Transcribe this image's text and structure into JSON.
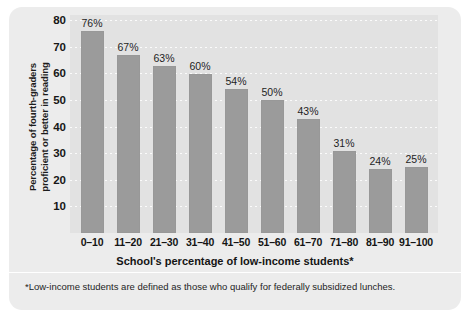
{
  "chart_data": {
    "type": "bar",
    "title": "",
    "subtitle": "",
    "xlabel": "School's percentage of low-income students*",
    "ylabel_line1": "Percentage of fourth-graders",
    "ylabel_line2": "proficient or better in reading",
    "categories": [
      "0–10",
      "11–20",
      "21–30",
      "31–40",
      "41–50",
      "51–60",
      "61–70",
      "71–80",
      "81–90",
      "91–100"
    ],
    "values": [
      76,
      67,
      63,
      60,
      54,
      50,
      43,
      31,
      24,
      25
    ],
    "value_labels": [
      "76%",
      "67%",
      "63%",
      "60%",
      "54%",
      "50%",
      "43%",
      "31%",
      "24%",
      "25%"
    ],
    "ylim": [
      0,
      82
    ],
    "yticks": [
      10,
      20,
      30,
      40,
      50,
      60,
      70,
      80
    ],
    "ytick_labels": [
      "10",
      "20",
      "30",
      "40",
      "50",
      "60",
      "70",
      "80"
    ],
    "grid": true,
    "grid_style": "dotted-white-horizontal",
    "legend": "none",
    "bar_color": "#9b9b9b",
    "plot_background": "#e2e2e2",
    "panel_background": "#ececec",
    "gridline_color": "#fbfbfb",
    "text_color": "#1c1c1c"
  },
  "footnote": {
    "text": "*Low-income students are defined as those who qualify for federally subsidized lunches."
  }
}
